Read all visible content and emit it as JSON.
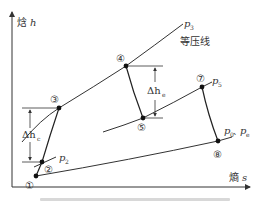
{
  "diagram": {
    "type": "pressure-enthalpy / h-s cycle diagram",
    "axes": {
      "y_label": "焓 h",
      "y_label_char": "焓",
      "y_label_var": "h",
      "x_label": "熵 s",
      "x_label_char": "熵",
      "x_label_var": "s"
    },
    "isobars": {
      "p3": {
        "label_main": "p",
        "label_sub": "3"
      },
      "p2": {
        "label_main": "p",
        "label_sub": "2"
      },
      "p5": {
        "label_main": "p",
        "label_sub": "5"
      },
      "p0_pe": {
        "label_a_main": "p",
        "label_a_sub": "0",
        "sep": "、",
        "label_b_main": "p",
        "label_b_sub": "e"
      }
    },
    "isobar_note": "等压线",
    "points": [
      {
        "id": "1",
        "label": "①"
      },
      {
        "id": "2",
        "label": "②"
      },
      {
        "id": "3",
        "label": "③"
      },
      {
        "id": "4",
        "label": "④"
      },
      {
        "id": "5",
        "label": "⑤"
      },
      {
        "id": "7",
        "label": "⑦"
      },
      {
        "id": "8",
        "label": "⑧"
      }
    ],
    "deltas": {
      "compression": {
        "main": "Δh",
        "sub": "c"
      },
      "expansion": {
        "main": "Δh",
        "sub": "e"
      }
    },
    "colors": {
      "line": "#333333",
      "point": "#111111",
      "caption": "#d8d8d8"
    }
  }
}
